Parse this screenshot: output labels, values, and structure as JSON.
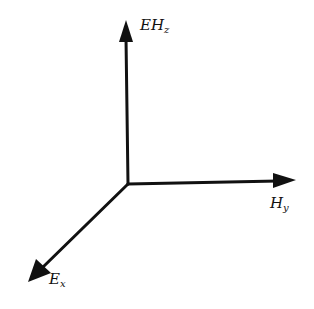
{
  "diagram": {
    "type": "3d-coordinate-axes",
    "axes": [
      {
        "id": "z",
        "label_main": "EH",
        "label_sub": "z",
        "direction": "up"
      },
      {
        "id": "y",
        "label_main": "H",
        "label_sub": "y",
        "direction": "right"
      },
      {
        "id": "x",
        "label_main": "E",
        "label_sub": "x",
        "direction": "down-left"
      }
    ],
    "stroke_color": "#111111"
  }
}
